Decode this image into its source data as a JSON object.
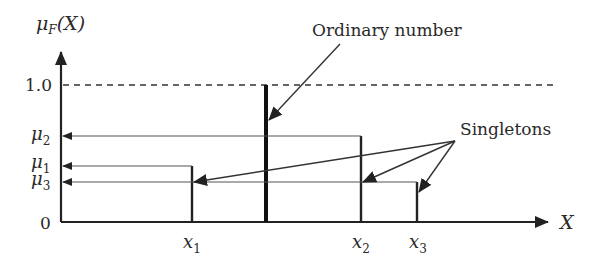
{
  "diagram": {
    "y_axis": {
      "label_main": "μ",
      "label_sub": "F",
      "label_arg": "(X)",
      "ticks": {
        "one": "1.0",
        "zero": "0"
      },
      "levels": [
        {
          "id": "mu2",
          "main": "μ",
          "sub": "2",
          "value_desc": "membership of x2"
        },
        {
          "id": "mu1",
          "main": "μ",
          "sub": "1",
          "value_desc": "membership of x1"
        },
        {
          "id": "mu3",
          "main": "μ",
          "sub": "3",
          "value_desc": "membership of x3"
        }
      ]
    },
    "x_axis": {
      "label": "X",
      "points": [
        {
          "id": "x1",
          "main": "x",
          "sub": "1"
        },
        {
          "id": "x2",
          "main": "x",
          "sub": "2"
        },
        {
          "id": "x3",
          "main": "x",
          "sub": "3"
        }
      ]
    },
    "annotations": {
      "ordinary": "Ordinary number",
      "singletons": "Singletons"
    },
    "colors": {
      "ink": "#2a2a2a",
      "thin_line": "#555555"
    }
  }
}
